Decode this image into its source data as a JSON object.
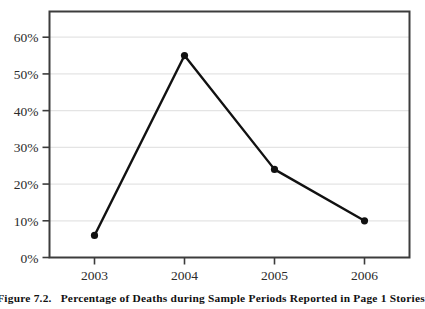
{
  "caption": {
    "label": "Figure 7.2.",
    "text": "Percentage of Deaths during Sample Periods Reported in Page 1 Stories"
  },
  "colors": {
    "line": "#111111",
    "marker": "#111111",
    "frame": "#3c3c3c",
    "grid": "#e4e4e4",
    "background": "#ffffff",
    "tick_text": "#2b2b2b"
  },
  "chart_data": {
    "type": "line",
    "title": "",
    "subtitle": "",
    "xlabel": "",
    "ylabel": "",
    "categories": [
      "2003",
      "2004",
      "2005",
      "2006"
    ],
    "x": [
      2003,
      2004,
      2005,
      2006
    ],
    "values": [
      6,
      55,
      24,
      10
    ],
    "series": [
      {
        "name": "Percentage of Deaths Reported in Page 1 Stories",
        "values": [
          6,
          55,
          24,
          10
        ]
      }
    ],
    "ylim": [
      0,
      67
    ],
    "ytick_values": [
      0,
      10,
      20,
      30,
      40,
      50,
      60
    ],
    "ytick_labels": [
      "0%",
      "10%",
      "20%",
      "30%",
      "40%",
      "50%",
      "60%"
    ],
    "xtick_labels": [
      "2003",
      "2004",
      "2005",
      "2006"
    ],
    "grid": true,
    "grid_axis": "y",
    "legend": false,
    "legend_position": "none",
    "marker": "filled-circle",
    "data_labels": false,
    "annotations": []
  }
}
